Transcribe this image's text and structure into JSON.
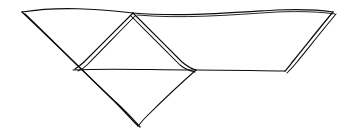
{
  "image": {
    "title": "Hand-drawn geometric line sketch",
    "kind": "line-drawing",
    "width": 355,
    "height": 139,
    "background_color": "#ffffff",
    "ink_color": "#0d0d0d",
    "description": "Freehand ink sketch of a folded polyhedral net: a wide shallow trapezoid whose left and right sides are drawn with doubled parallel strokes, containing an inverted central peak and a downward diamond point below a horizontal fold line."
  },
  "figure": {
    "name": "folded-net-sketch",
    "vertices": {
      "top_left": [
        22,
        12
      ],
      "top_right": [
        333,
        12
      ],
      "center_apex": [
        133,
        13
      ],
      "left_fold": [
        75,
        69
      ],
      "center_junction": [
        196,
        70
      ],
      "right_fold": [
        285,
        71
      ],
      "bottom_point": [
        138,
        126
      ]
    },
    "strokes": [
      {
        "name": "top-edge",
        "style": "single",
        "path": "M22,12 C60,6 96,9 133,13 C178,17 228,13 276,10 C300,9 320,10 333,12"
      },
      {
        "name": "top-edge-echo",
        "style": "echo",
        "path": "M137,15 C182,19 230,15 277,12 C302,11 322,12 335,14"
      },
      {
        "name": "left-diagonal-outer",
        "style": "doubled",
        "path": "M22,12 C52,40 86,74 117,104 C125,112 132,120 138,126"
      },
      {
        "name": "left-diagonal-inner",
        "style": "doubled",
        "path": "M25,14 C55,43 89,77 120,106 C128,114 135,121 140,127"
      },
      {
        "name": "center-peak-left",
        "style": "doubled",
        "path": "M133,13 C118,28 100,46 84,62 C81,65 78,67 75,69"
      },
      {
        "name": "center-peak-left-echo",
        "style": "doubled",
        "path": "M135,16 C120,31 103,49 87,65 C84,68 81,70 78,71"
      },
      {
        "name": "center-peak-right",
        "style": "doubled",
        "path": "M133,13 C148,28 166,46 182,62 C188,67 192,69 196,70"
      },
      {
        "name": "center-peak-right-echo",
        "style": "doubled",
        "path": "M131,16 C146,31 164,49 180,65 C186,70 191,71 195,72"
      },
      {
        "name": "horizontal-fold-line",
        "style": "single",
        "path": "M73,70 C110,68 150,70 196,70 C232,70 262,71 285,71"
      },
      {
        "name": "lower-diagonal-to-point",
        "style": "single",
        "path": "M196,70 C180,84 160,103 145,118 C142,121 140,124 138,126"
      },
      {
        "name": "right-diagonal-outer",
        "style": "doubled",
        "path": "M333,12 C322,25 307,44 294,60 C290,65 287,69 285,71"
      },
      {
        "name": "right-diagonal-inner",
        "style": "doubled",
        "path": "M336,14 C325,27 310,46 297,62 C293,67 289,71 287,73"
      }
    ]
  }
}
